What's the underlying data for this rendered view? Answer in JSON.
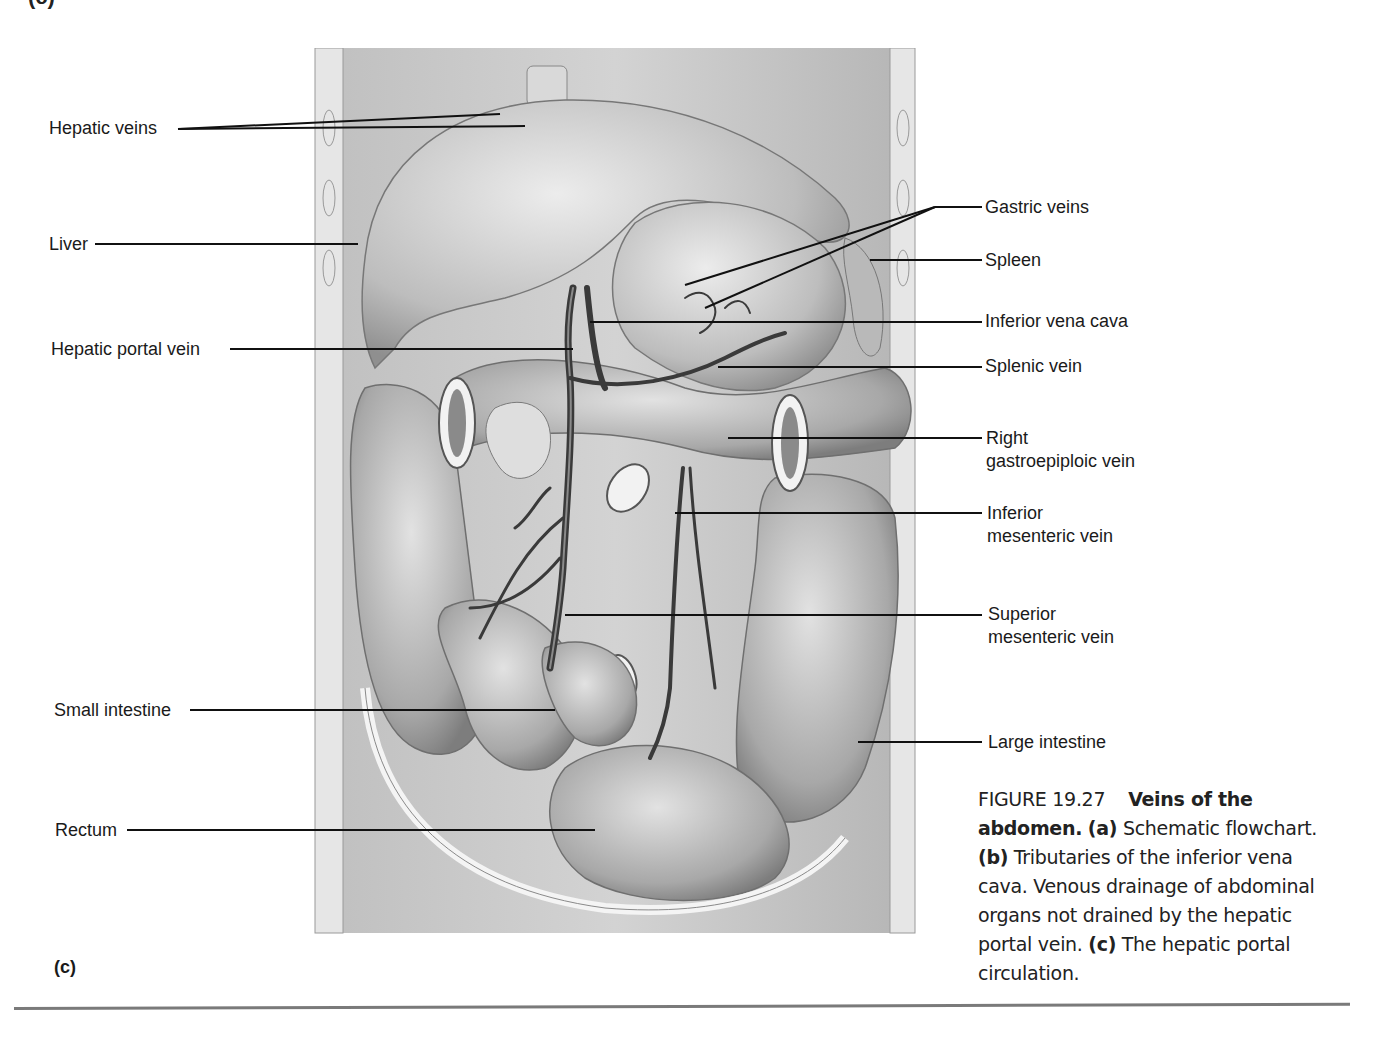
{
  "figure": {
    "top_panel_letter": "(c)",
    "panel_letter": "(c)",
    "labels_left": [
      {
        "id": "hepatic-veins",
        "text": "Hepatic veins",
        "x": 49,
        "y": 117
      },
      {
        "id": "liver",
        "text": "Liver",
        "x": 49,
        "y": 233
      },
      {
        "id": "hepatic-portal-vein",
        "text": "Hepatic portal vein",
        "x": 51,
        "y": 338
      },
      {
        "id": "small-intestine",
        "text": "Small intestine",
        "x": 54,
        "y": 699
      },
      {
        "id": "rectum",
        "text": "Rectum",
        "x": 55,
        "y": 819
      }
    ],
    "labels_right": [
      {
        "id": "gastric-veins",
        "text": "Gastric veins",
        "x": 985,
        "y": 196
      },
      {
        "id": "spleen",
        "text": "Spleen",
        "x": 985,
        "y": 249
      },
      {
        "id": "inferior-vena-cava",
        "text": "Inferior vena cava",
        "x": 985,
        "y": 310
      },
      {
        "id": "splenic-vein",
        "text": "Splenic vein",
        "x": 985,
        "y": 355
      },
      {
        "id": "right-gastroepiploic-vein",
        "text": "Right gastroepiploic vein",
        "line1": "Right",
        "line2": "gastroepiploic vein",
        "x": 986,
        "y": 427
      },
      {
        "id": "inferior-mesenteric-vein",
        "text": "Inferior mesenteric vein",
        "line1": "Inferior",
        "line2": "mesenteric vein",
        "x": 987,
        "y": 502
      },
      {
        "id": "superior-mesenteric-vein",
        "text": "Superior mesenteric vein",
        "line1": "Superior",
        "line2": "mesenteric vein",
        "x": 988,
        "y": 603
      },
      {
        "id": "large-intestine",
        "text": "Large intestine",
        "x": 988,
        "y": 731
      }
    ],
    "caption": {
      "figure_number": "FIGURE 19.27",
      "title": "Veins of the abdomen.",
      "part_a_label": "(a)",
      "part_a_text": " Schematic flowchart. ",
      "part_b_label": "(b)",
      "part_b_text": " Tributaries of the inferior vena cava. Venous drainage of abdominal organs not drained by the hepatic portal vein. ",
      "part_c_label": "(c)",
      "part_c_text": " The hepatic portal circulation."
    },
    "colors": {
      "text": "#1a1a1a",
      "leader_line": "#111111",
      "illustration_bg": "#c9c9c9",
      "organ_light": "#dcdcdc",
      "organ_mid": "#a9a9a9",
      "vein_dark": "#3a3a3a",
      "divider": "#7a7a7a"
    }
  }
}
